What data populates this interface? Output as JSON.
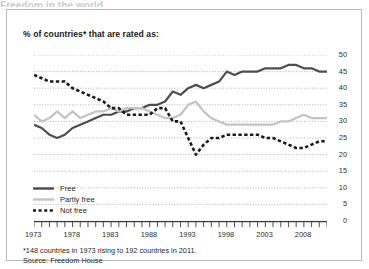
{
  "cut_title": "Freedom in the world",
  "subtitle": "% of countries* that are rated as:",
  "notes": {
    "footnote": "*148 countries in 1973 rising to 192 countries in 2011.",
    "source": "Source: Freedom House"
  },
  "legend": {
    "items": [
      {
        "label": "Free",
        "color": "#4d4d4d",
        "style": "solid"
      },
      {
        "label": "Partly free",
        "color": "#c3c3c3",
        "style": "solid"
      },
      {
        "label": "Not free",
        "color": "#1a1a1a",
        "style": "dashed"
      }
    ]
  },
  "colors": {
    "free": "#4d4d4d",
    "partly_free": "#c3c3c3",
    "not_free": "#1a1a1a",
    "grid": "#9d9d9d",
    "axis": "#3d3d3d",
    "border": "#b9bcbe",
    "text": "#1f1f1f"
  },
  "chart_data": {
    "type": "line",
    "title": "Freedom in the world",
    "subtitle": "% of countries* that are rated as:",
    "xlabel": "",
    "ylabel": "",
    "ylim": [
      0,
      50
    ],
    "yticks": [
      0,
      5,
      10,
      15,
      20,
      25,
      30,
      35,
      40,
      45,
      50
    ],
    "xlim": [
      1973,
      2011
    ],
    "xticks": [
      1973,
      1978,
      1983,
      1988,
      1993,
      1998,
      2003,
      2008
    ],
    "xtick_interval_minor": 1,
    "grid": "horizontal-dotted",
    "legend_position": "bottom-left",
    "x": [
      1973,
      1974,
      1975,
      1976,
      1977,
      1978,
      1979,
      1980,
      1981,
      1982,
      1983,
      1984,
      1985,
      1986,
      1987,
      1988,
      1989,
      1990,
      1991,
      1992,
      1993,
      1994,
      1995,
      1996,
      1997,
      1998,
      1999,
      2000,
      2001,
      2002,
      2003,
      2004,
      2005,
      2006,
      2007,
      2008,
      2009,
      2010,
      2011
    ],
    "series": [
      {
        "name": "Free",
        "color": "#4d4d4d",
        "style": "solid",
        "values": [
          29,
          28,
          26,
          25,
          26,
          28,
          29,
          30,
          31,
          32,
          32,
          33,
          33,
          34,
          34,
          35,
          35,
          36,
          39,
          38,
          40,
          41,
          40,
          41,
          42,
          45,
          44,
          45,
          45,
          45,
          46,
          46,
          46,
          47,
          47,
          46,
          46,
          45,
          45
        ]
      },
      {
        "name": "Partly free",
        "color": "#c3c3c3",
        "style": "solid",
        "values": [
          32,
          30,
          31,
          33,
          31,
          33,
          31,
          32,
          33,
          33,
          34,
          33,
          34,
          34,
          34,
          33,
          32,
          31,
          31,
          32,
          35,
          36,
          33,
          31,
          30,
          29,
          29,
          29,
          29,
          29,
          29,
          29,
          30,
          30,
          31,
          32,
          31,
          31,
          31
        ]
      },
      {
        "name": "Not free",
        "color": "#1a1a1a",
        "style": "dashed",
        "values": [
          44,
          43,
          42,
          42,
          42,
          40,
          39,
          38,
          37,
          36,
          34,
          34,
          32,
          32,
          32,
          32,
          34,
          34,
          30,
          30,
          25,
          20,
          23,
          25,
          25,
          26,
          26,
          26,
          26,
          26,
          25,
          25,
          24,
          23,
          22,
          22,
          23,
          24,
          24
        ]
      }
    ]
  }
}
